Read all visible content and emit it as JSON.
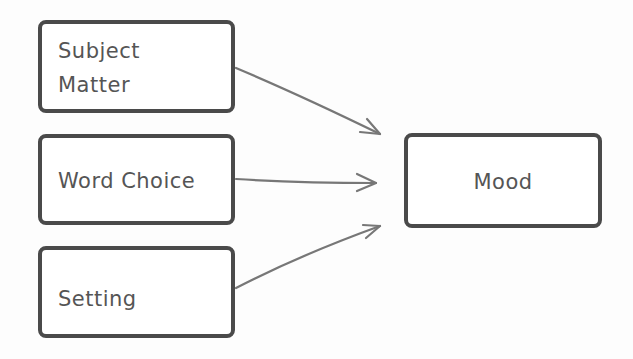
{
  "diagram": {
    "type": "flow",
    "sources": [
      {
        "id": "subject-matter",
        "label": "Subject Matter"
      },
      {
        "id": "word-choice",
        "label": "Word Choice"
      },
      {
        "id": "setting",
        "label": "Setting"
      }
    ],
    "target": {
      "id": "mood",
      "label": "Mood"
    },
    "edges": [
      {
        "from": "subject-matter",
        "to": "mood"
      },
      {
        "from": "word-choice",
        "to": "mood"
      },
      {
        "from": "setting",
        "to": "mood"
      }
    ],
    "colors": {
      "border": "#4a4a4a",
      "arrow": "#777777",
      "text": "#555555"
    }
  }
}
